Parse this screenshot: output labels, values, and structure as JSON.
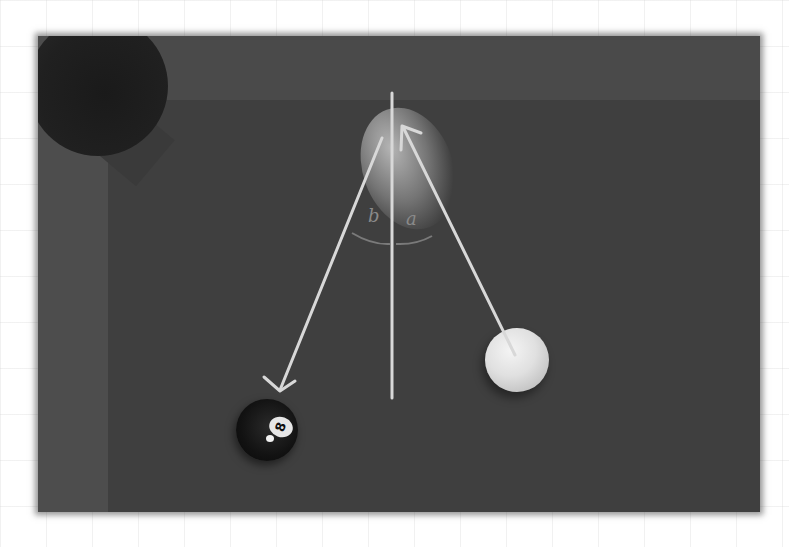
{
  "scene": {
    "description": "Overhead photo of a pool table corner with chalk-style annotations",
    "objects": {
      "cue_ball": {
        "label": "cue ball",
        "color": "#e6e6e6"
      },
      "eight_ball": {
        "label": "8 ball",
        "number": "8",
        "color": "#111111"
      },
      "ghost_ball": {
        "label": "contact / ghost ball position"
      },
      "pocket": {
        "label": "corner pocket"
      }
    },
    "annotations": {
      "angle_b": "b",
      "angle_a": "a",
      "line_color": "#d8d8d8",
      "lines": [
        {
          "name": "incoming-path",
          "from": "cue ball",
          "to": "ghost ball",
          "arrow": true
        },
        {
          "name": "outgoing-path",
          "from": "ghost ball",
          "to": "8 ball",
          "arrow": true
        },
        {
          "name": "normal-line",
          "from": "top cushion",
          "to": "table",
          "arrow": false
        }
      ]
    }
  }
}
